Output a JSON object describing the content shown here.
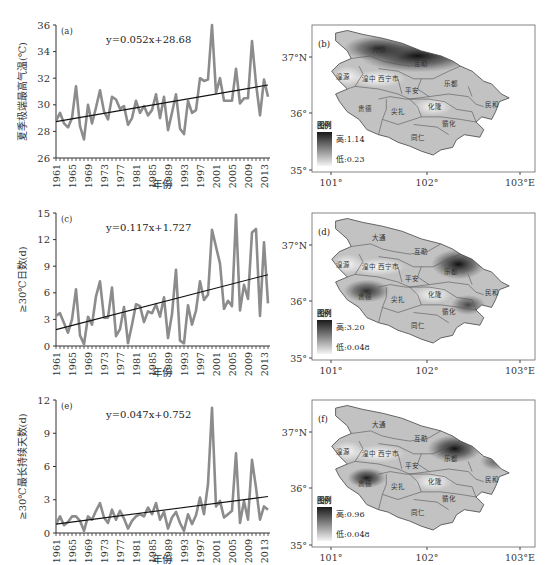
{
  "chart_data": [
    {
      "panel": "a",
      "type": "line",
      "title": "(a)",
      "xlabel": "年份",
      "ylabel": "夏季极端最高气温(℃)",
      "ylim": [
        26,
        36
      ],
      "yticks": [
        26,
        28,
        30,
        32,
        34,
        36
      ],
      "xtick_labels": [
        "1961",
        "1965",
        "1969",
        "1973",
        "1977",
        "1981",
        "1985",
        "1989",
        "1993",
        "1997",
        "2001",
        "2005",
        "2009",
        "2013"
      ],
      "x": [
        1961,
        1962,
        1963,
        1964,
        1965,
        1966,
        1967,
        1968,
        1969,
        1970,
        1971,
        1972,
        1973,
        1974,
        1975,
        1976,
        1977,
        1978,
        1979,
        1980,
        1981,
        1982,
        1983,
        1984,
        1985,
        1986,
        1987,
        1988,
        1989,
        1990,
        1991,
        1992,
        1993,
        1994,
        1995,
        1996,
        1997,
        1998,
        1999,
        2000,
        2001,
        2002,
        2003,
        2004,
        2005,
        2006,
        2007,
        2008,
        2009,
        2010,
        2011,
        2012,
        2013,
        2014
      ],
      "series": [
        {
          "name": "observed",
          "color": "#8c8c8c",
          "values": [
            28.8,
            29.4,
            28.6,
            28.3,
            29.0,
            31.4,
            28.4,
            27.4,
            30.0,
            28.6,
            29.8,
            31.1,
            29.5,
            28.9,
            30.6,
            30.4,
            29.7,
            29.9,
            28.5,
            29.0,
            30.3,
            29.4,
            29.9,
            29.2,
            29.6,
            30.8,
            29.0,
            30.6,
            28.1,
            29.4,
            30.8,
            28.2,
            27.8,
            30.3,
            29.4,
            29.6,
            32.0,
            31.8,
            31.9,
            36.0,
            30.9,
            32.0,
            30.3,
            30.3,
            30.3,
            32.7,
            30.1,
            30.5,
            30.5,
            34.8,
            31.6,
            29.2,
            31.9,
            30.6
          ]
        },
        {
          "name": "trend",
          "color": "#111111",
          "equation": "y=0.052x+28.68",
          "slope": 0.052,
          "intercept": 28.68
        }
      ],
      "equation_label": "y=0.052x+28.68"
    },
    {
      "panel": "c",
      "type": "line",
      "title": "(c)",
      "xlabel": "年份",
      "ylabel": "≥30℃日数(d)",
      "ylim": [
        0,
        15
      ],
      "yticks": [
        0,
        3,
        6,
        9,
        12,
        15
      ],
      "xtick_labels": [
        "1961",
        "1965",
        "1969",
        "1973",
        "1977",
        "1981",
        "1985",
        "1989",
        "1993",
        "1997",
        "2001",
        "2005",
        "2009",
        "2013"
      ],
      "x": [
        1961,
        1962,
        1963,
        1964,
        1965,
        1966,
        1967,
        1968,
        1969,
        1970,
        1971,
        1972,
        1973,
        1974,
        1975,
        1976,
        1977,
        1978,
        1979,
        1980,
        1981,
        1982,
        1983,
        1984,
        1985,
        1986,
        1987,
        1988,
        1989,
        1990,
        1991,
        1992,
        1993,
        1994,
        1995,
        1996,
        1997,
        1998,
        1999,
        2000,
        2001,
        2002,
        2003,
        2004,
        2005,
        2006,
        2007,
        2008,
        2009,
        2010,
        2011,
        2012,
        2013,
        2014
      ],
      "series": [
        {
          "name": "observed",
          "color": "#8c8c8c",
          "values": [
            3.4,
            3.7,
            2.6,
            1.5,
            3.0,
            6.4,
            1.2,
            0.2,
            3.3,
            2.4,
            5.6,
            7.3,
            3.2,
            3.2,
            6.6,
            1.1,
            1.9,
            4.4,
            0.3,
            2.4,
            4.7,
            4.5,
            2.7,
            3.9,
            3.7,
            4.7,
            3.3,
            5.5,
            0.9,
            3.6,
            8.6,
            0.6,
            0.3,
            4.6,
            2.4,
            4.0,
            7.3,
            5.2,
            5.8,
            13.1,
            11.2,
            9.3,
            4.2,
            5.1,
            4.5,
            14.8,
            4.0,
            6.9,
            5.3,
            12.8,
            13.2,
            3.4,
            11.7,
            4.8
          ]
        },
        {
          "name": "trend",
          "color": "#111111",
          "equation": "y=0.117x+1.727",
          "slope": 0.117,
          "intercept": 1.727
        }
      ],
      "equation_label": "y=0.117x+1.727"
    },
    {
      "panel": "e",
      "type": "line",
      "title": "(e)",
      "xlabel": "年份",
      "ylabel": "≥30℃最长持续天数(d)",
      "ylim": [
        0,
        12
      ],
      "yticks": [
        0,
        3,
        6,
        9,
        12
      ],
      "xtick_labels": [
        "1961",
        "1965",
        "1969",
        "1973",
        "1977",
        "1981",
        "1985",
        "1989",
        "1993",
        "1997",
        "2001",
        "2005",
        "2009",
        "2013"
      ],
      "x": [
        1961,
        1962,
        1963,
        1964,
        1965,
        1966,
        1967,
        1968,
        1969,
        1970,
        1971,
        1972,
        1973,
        1974,
        1975,
        1976,
        1977,
        1978,
        1979,
        1980,
        1981,
        1982,
        1983,
        1984,
        1985,
        1986,
        1987,
        1988,
        1989,
        1990,
        1991,
        1992,
        1993,
        1994,
        1995,
        1996,
        1997,
        1998,
        1999,
        2000,
        2001,
        2002,
        2003,
        2004,
        2005,
        2006,
        2007,
        2008,
        2009,
        2010,
        2011,
        2012,
        2013,
        2014
      ],
      "series": [
        {
          "name": "observed",
          "color": "#8c8c8c",
          "values": [
            0.8,
            1.5,
            0.7,
            1.0,
            1.5,
            1.5,
            1.1,
            0.2,
            1.5,
            1.2,
            2.0,
            2.7,
            1.4,
            0.9,
            2.1,
            1.2,
            2.0,
            1.3,
            0.4,
            1.1,
            1.5,
            1.7,
            1.5,
            2.3,
            1.7,
            2.7,
            1.2,
            1.9,
            0.4,
            1.4,
            1.9,
            0.9,
            0.2,
            1.7,
            0.8,
            1.6,
            3.2,
            1.7,
            4.4,
            11.3,
            2.4,
            2.9,
            1.4,
            1.7,
            2.0,
            7.2,
            0.9,
            2.9,
            1.2,
            6.6,
            4.1,
            1.2,
            2.4,
            2.1
          ]
        },
        {
          "name": "trend",
          "color": "#111111",
          "equation": "y=0.047x+0.752",
          "slope": 0.047,
          "intercept": 0.752
        }
      ],
      "equation_label": "y=0.047x+0.752"
    }
  ],
  "maps": [
    {
      "panel": "b",
      "label": "(b)",
      "legend_title": "图例",
      "legend_high": "高:1.14",
      "legend_low": "低:0.23",
      "hotspots": [
        {
          "cx": 0.5,
          "cy": 0.22,
          "rx": 0.3,
          "ry": 0.13,
          "intensity": 1.0
        },
        {
          "cx": 0.3,
          "cy": 0.16,
          "rx": 0.18,
          "ry": 0.1,
          "intensity": 0.85
        }
      ]
    },
    {
      "panel": "d",
      "label": "(d)",
      "legend_title": "图例",
      "legend_high": "高:3.20",
      "legend_low": "低:0.048",
      "hotspots": [
        {
          "cx": 0.71,
          "cy": 0.38,
          "rx": 0.14,
          "ry": 0.12,
          "intensity": 1.0
        },
        {
          "cx": 0.24,
          "cy": 0.59,
          "rx": 0.12,
          "ry": 0.09,
          "intensity": 0.85
        },
        {
          "cx": 0.76,
          "cy": 0.7,
          "rx": 0.09,
          "ry": 0.08,
          "intensity": 0.7
        }
      ]
    },
    {
      "panel": "f",
      "label": "(f)",
      "legend_title": "图例",
      "legend_high": "高:0.96",
      "legend_low": "低:0.048",
      "hotspots": [
        {
          "cx": 0.69,
          "cy": 0.36,
          "rx": 0.14,
          "ry": 0.11,
          "intensity": 1.0
        },
        {
          "cx": 0.24,
          "cy": 0.59,
          "rx": 0.1,
          "ry": 0.08,
          "intensity": 0.95
        },
        {
          "cx": 0.9,
          "cy": 0.46,
          "rx": 0.08,
          "ry": 0.07,
          "intensity": 0.55
        }
      ]
    }
  ],
  "map_common": {
    "lat_labels": [
      "37°N",
      "36°",
      "35°"
    ],
    "lon_labels": [
      "101°",
      "102°",
      "103°E"
    ],
    "place_names": [
      {
        "name": "大通",
        "x": 0.3,
        "y": 0.17
      },
      {
        "name": "互助",
        "x": 0.52,
        "y": 0.28
      },
      {
        "name": "湟源",
        "x": 0.12,
        "y": 0.38
      },
      {
        "name": "湟中",
        "x": 0.25,
        "y": 0.4
      },
      {
        "name": "西宁市",
        "x": 0.35,
        "y": 0.4
      },
      {
        "name": "平安",
        "x": 0.47,
        "y": 0.49
      },
      {
        "name": "乐都",
        "x": 0.67,
        "y": 0.44
      },
      {
        "name": "民和",
        "x": 0.88,
        "y": 0.6
      },
      {
        "name": "贵德",
        "x": 0.23,
        "y": 0.63
      },
      {
        "name": "尖扎",
        "x": 0.4,
        "y": 0.66
      },
      {
        "name": "化隆",
        "x": 0.59,
        "y": 0.62
      },
      {
        "name": "循化",
        "x": 0.66,
        "y": 0.75
      },
      {
        "name": "同仁",
        "x": 0.5,
        "y": 0.86
      }
    ]
  },
  "colors": {
    "series": "#8c8c8c",
    "trend": "#111111",
    "map_base": "#c2c2c2",
    "map_dark": "#1a1a1a",
    "map_light": "#f4f4f4",
    "border": "#555555"
  }
}
